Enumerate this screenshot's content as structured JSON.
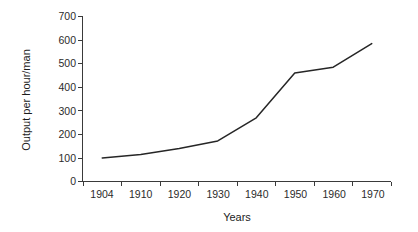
{
  "chart_data": {
    "type": "line",
    "title": "",
    "xlabel": "Years",
    "ylabel": "Output per hour/man",
    "categories": [
      "1904",
      "1910",
      "1920",
      "1930",
      "1940",
      "1950",
      "1960",
      "1970"
    ],
    "values": [
      100,
      115,
      140,
      172,
      270,
      460,
      485,
      585
    ],
    "series": [
      {
        "name": "Output per hour/man",
        "values": [
          100,
          115,
          140,
          172,
          270,
          460,
          485,
          585
        ]
      }
    ],
    "ylim": [
      0,
      700
    ],
    "ytick_labels": [
      "0",
      "100",
      "200",
      "300",
      "400",
      "500",
      "600",
      "700"
    ],
    "ytick_values": [
      0,
      100,
      200,
      300,
      400,
      500,
      600,
      700
    ],
    "grid": false,
    "legend": false,
    "legend_position": "none",
    "markers": false,
    "line_color": "#262626",
    "background_color": "#ffffff",
    "axis_color": "#3a3a3a",
    "text_color": "#2b2b2b"
  }
}
